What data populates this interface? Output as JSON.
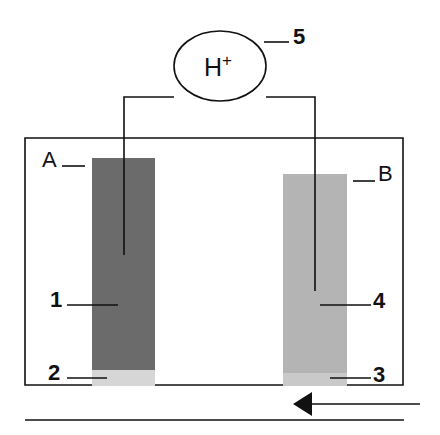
{
  "diagram": {
    "ion_label": "H",
    "ion_charge": "+",
    "labels": {
      "A": "A",
      "B": "B",
      "n1": "1",
      "n2": "2",
      "n3": "3",
      "n4": "4",
      "n5": "5"
    },
    "colors": {
      "electrode_A": "#6b6b6b",
      "electrode_A_base": "#d6d6d6",
      "electrode_B": "#b4b4b4",
      "electrode_B_base": "#c9c9c9",
      "line": "#111111"
    },
    "flow_direction": "right-to-left"
  }
}
